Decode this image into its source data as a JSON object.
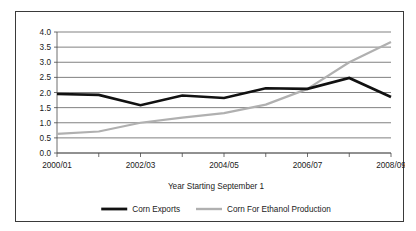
{
  "chart_data": {
    "type": "line",
    "title": "",
    "xlabel": "Year Starting September 1",
    "ylabel": "",
    "categories": [
      "2000/01",
      "2001/02",
      "2002/03",
      "2003/04",
      "2004/05",
      "2005/06",
      "2006/07",
      "2007/08",
      "2008/09"
    ],
    "tick_labels_x": [
      "2000/01",
      "",
      "2002/03",
      "",
      "2004/05",
      "",
      "2006/07",
      "",
      "2008/09"
    ],
    "tick_labels_y": [
      "0.0",
      "0.5",
      "1.0",
      "1.5",
      "2.0",
      "2.5",
      "3.0",
      "3.5",
      "4.0"
    ],
    "ylim": [
      0.0,
      4.0
    ],
    "ytick_step": 0.5,
    "grid": "horizontal",
    "legend_position": "bottom",
    "series": [
      {
        "name": "Corn Exports",
        "color": "#111111",
        "values": [
          1.95,
          1.92,
          1.58,
          1.9,
          1.82,
          2.14,
          2.12,
          2.48,
          1.85
        ]
      },
      {
        "name": "Corn For Ethanol Production",
        "color": "#b0b0b0",
        "values": [
          0.63,
          0.71,
          1.0,
          1.17,
          1.32,
          1.6,
          2.12,
          3.0,
          3.67
        ]
      }
    ]
  },
  "legend": {
    "items": [
      {
        "label": "Corn Exports"
      },
      {
        "label": "Corn For Ethanol Production"
      }
    ]
  }
}
